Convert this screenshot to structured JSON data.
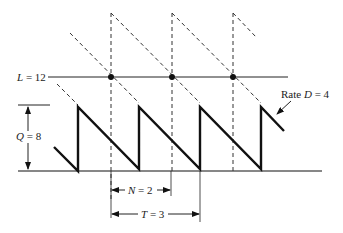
{
  "diagram": {
    "labels": {
      "reorder_level": {
        "var": "L",
        "eq": " = 12"
      },
      "order_quantity": {
        "var": "Q",
        "eq": " = 8"
      },
      "demand_rate": {
        "prefix": "Rate ",
        "var": "D",
        "eq": " = 4"
      },
      "lead_time": {
        "var": "N",
        "eq": " = 2"
      },
      "cycle_time": {
        "var": "T",
        "eq": " = 3"
      }
    },
    "values": {
      "L": 12,
      "Q": 8,
      "D": 4,
      "N": 2,
      "T": 3
    },
    "colors": {
      "line": "#111111",
      "dashed": "#333333",
      "background": "#ffffff"
    }
  }
}
